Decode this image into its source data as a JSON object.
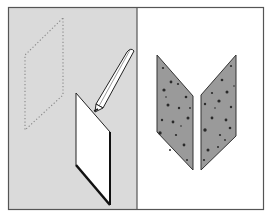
{
  "figure": {
    "colors": {
      "left_panel_bg": "#dadada",
      "right_panel_bg": "#ffffff",
      "frame": "#555555",
      "shape_fill": "#9a9a9a",
      "shape_edge": "#333333",
      "speckle": "#2a2a2a",
      "dotted_outline": "#888888"
    },
    "panels": [
      {
        "name": "left",
        "contents": [
          "dotted-parallelogram-outline",
          "white-parallelogram-card",
          "pencil"
        ]
      },
      {
        "name": "right",
        "contents": [
          "left-speckled-parallelogram",
          "right-speckled-parallelogram"
        ]
      }
    ]
  }
}
